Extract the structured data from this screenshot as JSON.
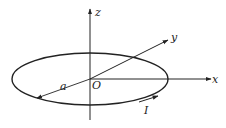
{
  "diagram": {
    "type": "circular current loop in 3D coordinate system",
    "colors": {
      "stroke": "#222222",
      "background": "#ffffff"
    },
    "axes": {
      "x_label": "x",
      "y_label": "y",
      "z_label": "z"
    },
    "origin_label": "O",
    "radius_label": "a",
    "current_label": "I"
  }
}
